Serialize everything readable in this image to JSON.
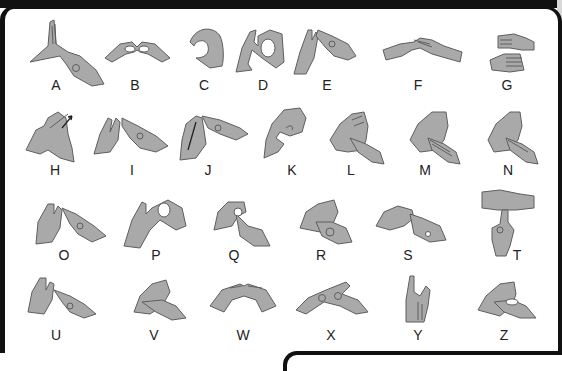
{
  "colors": {
    "frame": "#111111",
    "hand_fill": "#a9a9a9",
    "hand_outline": "#5e5e5e",
    "label": "#222222",
    "background": "#ffffff"
  },
  "rows": [
    {
      "label_y": 78,
      "signs": [
        {
          "letter": "A",
          "x": 56
        },
        {
          "letter": "B",
          "x": 135
        },
        {
          "letter": "C",
          "x": 204
        },
        {
          "letter": "D",
          "x": 263
        },
        {
          "letter": "E",
          "x": 327
        },
        {
          "letter": "F",
          "x": 418
        },
        {
          "letter": "G",
          "x": 507
        }
      ]
    },
    {
      "label_y": 163,
      "signs": [
        {
          "letter": "H",
          "x": 55
        },
        {
          "letter": "I",
          "x": 132
        },
        {
          "letter": "J",
          "x": 208
        },
        {
          "letter": "K",
          "x": 292
        },
        {
          "letter": "L",
          "x": 351
        },
        {
          "letter": "M",
          "x": 425
        },
        {
          "letter": "N",
          "x": 508
        }
      ]
    },
    {
      "label_y": 248,
      "signs": [
        {
          "letter": "O",
          "x": 64
        },
        {
          "letter": "P",
          "x": 156
        },
        {
          "letter": "Q",
          "x": 234
        },
        {
          "letter": "R",
          "x": 321
        },
        {
          "letter": "S",
          "x": 408
        },
        {
          "letter": "T",
          "x": 517
        }
      ]
    },
    {
      "label_y": 328,
      "signs": [
        {
          "letter": "U",
          "x": 56
        },
        {
          "letter": "V",
          "x": 154
        },
        {
          "letter": "W",
          "x": 243
        },
        {
          "letter": "X",
          "x": 331
        },
        {
          "letter": "Y",
          "x": 418
        },
        {
          "letter": "Z",
          "x": 504
        }
      ]
    }
  ],
  "icons": {
    "hand": "hand-illustration",
    "motion_arrow": "motion-arrow"
  }
}
